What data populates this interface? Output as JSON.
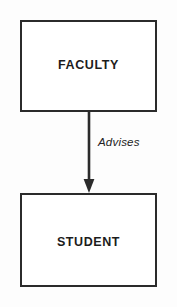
{
  "diagram": {
    "type": "entity-relationship",
    "title": "Faculty Advises Student",
    "background_color": "#fdfdfd",
    "line_color": "#2b2b2b",
    "text_color": "#1c1c1c",
    "entities": [
      {
        "id": "faculty",
        "label": "FACULTY",
        "shape": "rectangle"
      },
      {
        "id": "student",
        "label": "STUDENT",
        "shape": "rectangle"
      }
    ],
    "relationships": [
      {
        "id": "advises",
        "label": "Advises",
        "from": "faculty",
        "to": "student",
        "style": "solid-arrow",
        "direction": "down"
      }
    ]
  }
}
